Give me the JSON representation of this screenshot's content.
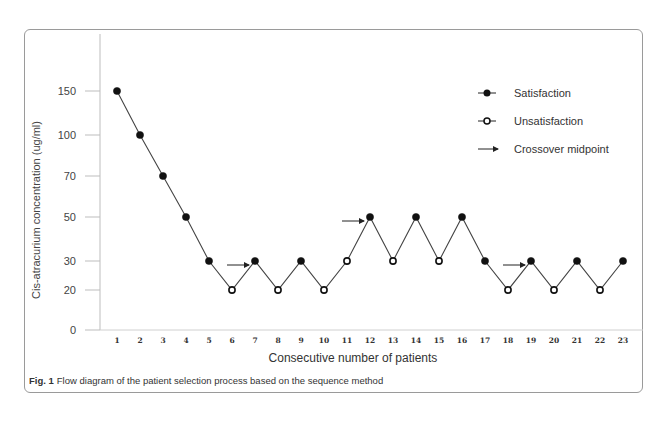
{
  "figure": {
    "caption_label": "Fig. 1",
    "caption_text": "Flow diagram of the patient selection process based on the sequence method"
  },
  "chart_data": {
    "type": "line",
    "title": "",
    "xlabel": "Consecutive number of patients",
    "ylabel": "Cis-atracurium concentration (ug/ml)",
    "x": [
      1,
      2,
      3,
      4,
      5,
      6,
      7,
      8,
      9,
      10,
      11,
      12,
      13,
      14,
      15,
      16,
      17,
      18,
      19,
      20,
      21,
      22,
      23
    ],
    "y_ticks": [
      0,
      20,
      30,
      50,
      70,
      100,
      150
    ],
    "values": [
      150,
      100,
      70,
      50,
      30,
      20,
      30,
      20,
      30,
      20,
      30,
      50,
      30,
      50,
      30,
      50,
      30,
      20,
      30,
      20,
      30,
      20,
      30
    ],
    "outcome": [
      "S",
      "S",
      "S",
      "S",
      "S",
      "U",
      "S",
      "U",
      "S",
      "U",
      "U",
      "S",
      "U",
      "S",
      "U",
      "S",
      "S",
      "U",
      "S",
      "U",
      "S",
      "U",
      "S"
    ],
    "crossover_midpoints": [
      {
        "from": 6,
        "to": 7
      },
      {
        "from": 11,
        "to": 12
      },
      {
        "from": 18,
        "to": 19
      }
    ],
    "legend": [
      {
        "marker": "filled-circle",
        "label": "Satisfaction"
      },
      {
        "marker": "open-circle",
        "label": "Unsatisfaction"
      },
      {
        "marker": "arrow",
        "label": "Crossover midpoint"
      }
    ],
    "legend_position": "top-right",
    "grid": false
  }
}
